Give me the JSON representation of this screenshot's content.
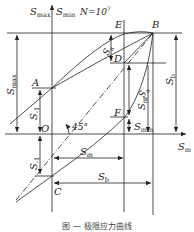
{
  "diagram": {
    "type": "limit-stress-diagram",
    "axis_y_label_1": "S",
    "axis_y_label_1_sub": "max",
    "axis_y_label_2": "S",
    "axis_y_label_2_sub": "min",
    "cycles_label": "N=10",
    "cycles_exp": "7",
    "axis_x_label": "S",
    "axis_x_label_sub": "m",
    "angle_label": "45°",
    "points": {
      "A": "A",
      "B": "B",
      "C": "C",
      "D": "D",
      "E": "E",
      "F": "F",
      "O": "O"
    },
    "dimensions": {
      "smax": {
        "main": "S",
        "sub": "max"
      },
      "s_minus1_upper": {
        "main": "S",
        "sub": "-1"
      },
      "s_minus1_lower": {
        "main": "S",
        "sub": "-1"
      },
      "sa_top": {
        "main": "S",
        "sub": "a"
      },
      "sa_right": {
        "main": "S",
        "sub": "a"
      },
      "sm_vertical": {
        "main": "S",
        "sub": "m"
      },
      "sb_vertical": {
        "main": "S",
        "sub": "b"
      },
      "smin": {
        "main": "S",
        "sub": "min"
      },
      "sm_horizontal": {
        "main": "S",
        "sub": "m"
      },
      "sb_horizontal": {
        "main": "S",
        "sub": "b"
      }
    },
    "caption": "图 — 极限应力曲线"
  }
}
